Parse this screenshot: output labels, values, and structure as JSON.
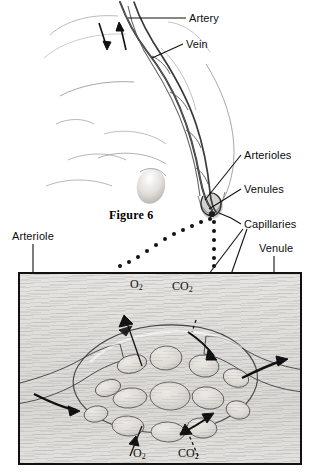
{
  "figure": {
    "caption": "Figure 6",
    "style": "grayscale pencil / airbrush anatomical illustration"
  },
  "labels": {
    "artery": "Artery",
    "vein": "Vein",
    "arterioles": "Arterioles",
    "venules": "Venules",
    "capillaries": "Capillaries",
    "arteriole": "Arteriole",
    "venule": "Venule"
  },
  "gases": {
    "oxygen_top": "O",
    "oxygen_top_sub": "2",
    "carbon_dioxide_top": "CO",
    "carbon_dioxide_top_sub": "2",
    "oxygen_bottom": "O",
    "oxygen_bottom_sub": "2",
    "carbon_dioxide_bottom": "CO",
    "carbon_dioxide_bottom_sub": "2"
  },
  "colors": {
    "ink": "#0d0d0d",
    "box_border": "#111111",
    "tissue_light": "#e6e4e0",
    "tissue_mid": "#d9d7d3",
    "vessel_dark": "#4a4a4a",
    "vessel_mid": "#8d8d8d",
    "vessel_light": "#cfcfcf",
    "skin_light": "#f2f0ee",
    "skin_mid": "#c9c6c2",
    "skin_shadow": "#8a8682"
  },
  "icons": {
    "leader_line": "leader-line",
    "dotted_leader": "dotted-leader-line",
    "flow_arrow": "flow-arrow",
    "diffusion_arrow": "diffusion-arrow"
  }
}
